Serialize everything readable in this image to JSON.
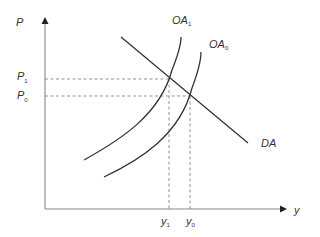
{
  "diagram": {
    "type": "economics-supply-demand",
    "axes": {
      "y_label": "P",
      "x_label": "y"
    },
    "curves": [
      {
        "id": "OA1",
        "label_main": "OA",
        "label_sub": "1",
        "kind": "aggregate-supply"
      },
      {
        "id": "OA0",
        "label_main": "OA",
        "label_sub": "0",
        "kind": "aggregate-supply"
      },
      {
        "id": "DA",
        "label_main": "DA",
        "label_sub": "",
        "kind": "aggregate-demand"
      }
    ],
    "price_levels": [
      {
        "label_main": "P",
        "label_sub": "1"
      },
      {
        "label_main": "P",
        "label_sub": "0"
      }
    ],
    "output_levels": [
      {
        "label_main": "y",
        "label_sub": "1"
      },
      {
        "label_main": "y",
        "label_sub": "0"
      }
    ]
  },
  "colors": {
    "axis": "#888888",
    "curve": "#333333",
    "dashed": "#777777",
    "text": "#333333"
  }
}
